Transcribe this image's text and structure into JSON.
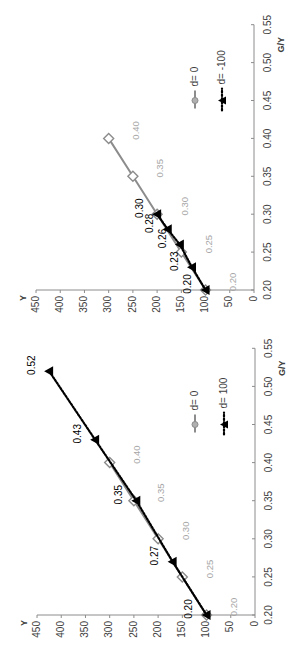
{
  "chart_data": [
    {
      "type": "line",
      "title": "",
      "xlabel": "Y",
      "ylabel": "G/Y",
      "orientation": "rotated 90deg counter-clockwise (Y axis runs horizontally at bottom reading 450 to 0 left to right; G/Y axis runs vertically on right)",
      "xlim": [
        0,
        450
      ],
      "ylim": [
        0.2,
        0.55
      ],
      "x_ticks": [
        "0",
        "50",
        "100",
        "150",
        "200",
        "250",
        "300",
        "350",
        "400",
        "450"
      ],
      "y_ticks": [
        "0.20",
        "0.25",
        "0.30",
        "0.35",
        "0.40",
        "0.45",
        "0.50",
        "0.55"
      ],
      "grid": false,
      "legend_position": "upper right (inside plot)",
      "series": [
        {
          "name": "d= 0",
          "color": "#8c8c8c",
          "line": "solid",
          "marker": "open-diamond",
          "label_color": "#a6a6a6",
          "points": [
            {
              "x": 100,
              "y": 0.2,
              "label": "0.20"
            },
            {
              "x": 150,
              "y": 0.25,
              "label": "0.25"
            },
            {
              "x": 200,
              "y": 0.3,
              "label": "0.30"
            },
            {
              "x": 250,
              "y": 0.35,
              "label": "0.35"
            },
            {
              "x": 300,
              "y": 0.4,
              "label": "0.40"
            }
          ]
        },
        {
          "name": "d= -100",
          "color": "#000000",
          "line": "dotted",
          "marker": "filled-triangle",
          "label_color": "#000000",
          "points": [
            {
              "x": 100,
              "y": 0.2,
              "label": "0.20"
            },
            {
              "x": 128,
              "y": 0.23,
              "label": "0.23"
            },
            {
              "x": 153,
              "y": 0.26,
              "label": "0.26"
            },
            {
              "x": 178,
              "y": 0.28,
              "label": "0.28"
            },
            {
              "x": 200,
              "y": 0.3,
              "label": "0.30"
            }
          ]
        }
      ]
    },
    {
      "type": "line",
      "title": "",
      "xlabel": "Y",
      "ylabel": "G/Y",
      "orientation": "rotated 90deg counter-clockwise (Y axis runs horizontally at bottom reading 450 to 0 left to right; G/Y axis runs vertically on right)",
      "xlim": [
        0,
        450
      ],
      "ylim": [
        0.2,
        0.55
      ],
      "x_ticks": [
        "0",
        "50",
        "100",
        "150",
        "200",
        "250",
        "300",
        "350",
        "400",
        "450"
      ],
      "y_ticks": [
        "0.20",
        "0.25",
        "0.30",
        "0.35",
        "0.40",
        "0.45",
        "0.50",
        "0.55"
      ],
      "grid": false,
      "legend_position": "upper right (inside plot)",
      "series": [
        {
          "name": "d= 0",
          "color": "#8c8c8c",
          "line": "solid",
          "marker": "open-diamond",
          "label_color": "#a6a6a6",
          "points": [
            {
              "x": 100,
              "y": 0.2,
              "label": "0.20"
            },
            {
              "x": 150,
              "y": 0.25,
              "label": "0.25"
            },
            {
              "x": 200,
              "y": 0.3,
              "label": "0.30"
            },
            {
              "x": 250,
              "y": 0.35,
              "label": "0.35"
            },
            {
              "x": 300,
              "y": 0.4,
              "label": "0.40"
            }
          ]
        },
        {
          "name": "d= 100",
          "color": "#000000",
          "line": "dotted",
          "marker": "filled-triangle",
          "label_color": "#000000",
          "points": [
            {
              "x": 100,
              "y": 0.2,
              "label": "0.20"
            },
            {
              "x": 170,
              "y": 0.27,
              "label": "0.27"
            },
            {
              "x": 245,
              "y": 0.35,
              "label": "0.35"
            },
            {
              "x": 330,
              "y": 0.43,
              "label": "0.43"
            },
            {
              "x": 425,
              "y": 0.52,
              "label": "0.52"
            }
          ]
        }
      ]
    }
  ],
  "layout": [
    {
      "x0": 254,
      "xscale": 0.4844,
      "y0": 290,
      "yscale": 758,
      "ymin": 0.2,
      "ymax": 0.55
    },
    {
      "x0": 255,
      "xscale": 0.4844,
      "y0": 615,
      "yscale": 762,
      "ymin": 0.2,
      "ymax": 0.55
    }
  ]
}
